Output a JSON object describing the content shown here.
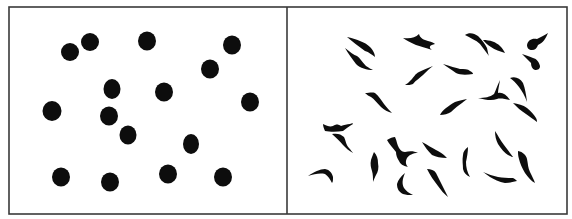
{
  "figure": {
    "width": 572,
    "height": 219,
    "frame": {
      "x": 9,
      "y": 7,
      "w": 558,
      "h": 207,
      "divider_x": 287,
      "color": "#3a3a3a"
    },
    "ink_color": "#0d0d0d",
    "background": "#ffffff"
  },
  "panels": [
    {
      "name": "left-panel-round-dots",
      "description": "round dots",
      "count": 16,
      "dots": [
        {
          "cx": 70,
          "cy": 52,
          "rx": 9,
          "ry": 9
        },
        {
          "cx": 90,
          "cy": 42,
          "rx": 9,
          "ry": 9
        },
        {
          "cx": 147,
          "cy": 41,
          "rx": 9,
          "ry": 9.5
        },
        {
          "cx": 232,
          "cy": 45,
          "rx": 9,
          "ry": 9.5
        },
        {
          "cx": 210,
          "cy": 69,
          "rx": 9,
          "ry": 9.5
        },
        {
          "cx": 112,
          "cy": 89,
          "rx": 8.5,
          "ry": 10
        },
        {
          "cx": 164,
          "cy": 92,
          "rx": 9,
          "ry": 9.5
        },
        {
          "cx": 52,
          "cy": 111,
          "rx": 9.5,
          "ry": 10
        },
        {
          "cx": 250,
          "cy": 102,
          "rx": 9,
          "ry": 9.5
        },
        {
          "cx": 109,
          "cy": 116,
          "rx": 9,
          "ry": 9.5
        },
        {
          "cx": 128,
          "cy": 135,
          "rx": 8.5,
          "ry": 9.5
        },
        {
          "cx": 191,
          "cy": 144,
          "rx": 8,
          "ry": 10
        },
        {
          "cx": 61,
          "cy": 177,
          "rx": 9,
          "ry": 9.5
        },
        {
          "cx": 110,
          "cy": 182,
          "rx": 9,
          "ry": 9.5
        },
        {
          "cx": 168,
          "cy": 174,
          "rx": 9,
          "ry": 9.5
        },
        {
          "cx": 223,
          "cy": 177,
          "rx": 9,
          "ry": 9.5
        }
      ]
    },
    {
      "name": "right-panel-irregular-spindle-shapes",
      "description": "elongated irregular spindle-shaped forms",
      "count": 25,
      "cells": [
        "M347,37 C356,39 365,42 370,47 C374,51 375,55 375,57 C372,55 369,52 365,51 C358,46 352,41 347,37 Z",
        "M345,48 C350,52 354,55 357,56 C360,58 362,62 366,66 C369,68 371,69 373,70 C367,70 360,68 356,64 C352,59 348,53 345,48 Z",
        "M403,38 C410,39 415,38 419,34 C420,38 424,40 428,41 C432,42 434,43 435,44 C430,45 428,47 432,50 C426,48 420,46 416,45 C411,43 406,40 403,38 Z",
        "M465,35 C469,32 474,33 478,36 C482,40 485,44 487,48 C488,52 488,54 489,56 C486,52 483,48 480,44 C476,40 470,38 465,35 Z M483,40 C490,40 496,42 500,46 C503,49 504,51 505,53 C500,51 495,50 491,47 C487,45 485,42 483,40 Z",
        "M527,45 C528,40 532,38 537,39 C541,37 545,35 548,33 C546,38 543,43 538,45 C537,48 535,50 532,50 C529,50 527,48 527,45 Z",
        "M522,54 C526,55 530,57 533,58 C537,59 539,62 540,66 C540,69 538,70 535,70 C532,69 531,66 531,63 C528,60 525,57 522,54 Z",
        "M433,66 C428,68 423,70 419,72 C415,74 414,77 411,80 C409,82 407,84 405,85 C408,85 411,85 413,84 C416,80 420,78 423,75 C427,71 430,68 433,66 Z",
        "M443,64 C450,66 456,68 460,69 C464,69 468,69 470,71 C472,72 473,73 473,74 C466,75 460,75 456,73 C452,70 447,67 443,64 Z",
        "M365,93 C369,93 372,92 375,93 C379,96 381,100 384,104 C387,108 390,111 392,113 C388,112 384,110 381,107 C377,103 374,99 371,97 C369,96 367,95 365,93 Z",
        "M467,99 C462,100 458,101 455,102 C451,104 449,106 446,108 C443,110 441,113 440,115 C444,115 448,114 451,112 C455,108 459,105 462,103 C464,101 466,100 467,99 Z",
        "M478,98 C485,98 490,97 494,94 C496,90 497,86 500,80 C499,86 498,90 498,93 C502,92 506,94 510,100 C505,99 500,98 497,99 C492,101 486,100 478,98 Z",
        "M510,78 C515,76 520,78 523,83 C525,88 526,94 527,102 C525,96 522,91 519,87 C516,83 513,80 510,78 Z",
        "M513,103 C518,104 523,105 527,108 C531,111 534,115 536,118 C537,120 537,121 537,122 C533,119 529,116 526,114 C521,111 517,107 513,103 Z",
        "M323,124 C327,126 330,127 333,126 C336,124 338,124 341,126 C344,125 347,124 350,124 C352,123 353,123 353,124 C349,126 346,129 343,131 C337,132 330,132 325,131 C324,129 323,126 323,124 Z",
        "M332,134 C337,133 341,134 344,137 C346,141 346,145 349,148 C351,150 352,152 353,153 C349,151 346,148 343,145 C340,141 336,138 332,134 Z",
        "M387,140 C390,138 393,137 395,137 C397,141 397,145 399,148 C401,151 403,152 405,152 C410,151 414,151 418,153 C413,153 409,155 407,158 C405,162 406,165 408,167 C403,166 400,164 399,161 C397,158 396,155 396,152 C393,148 389,144 387,140 Z",
        "M422,142 C428,145 432,148 436,150 C440,152 443,154 445,156 C446,157 447,158 447,158 C441,158 436,157 432,155 C428,151 425,147 422,142 Z",
        "M468,147 C465,149 463,152 463,155 C462,160 463,165 463,169 C464,173 466,175 470,177 C467,172 466,167 466,162 C467,157 468,152 468,147 Z",
        "M495,131 C495,136 496,140 498,144 C501,149 505,153 508,155 C510,156 512,157 513,157 C510,153 507,149 504,145 C500,140 498,135 495,131 Z",
        "M518,151 C523,152 526,155 527,159 C528,164 528,168 530,172 C532,176 534,180 535,183 C531,181 528,177 525,173 C522,168 520,163 519,159 C518,156 518,153 518,151 Z",
        "M374,152 C377,155 378,159 378,163 C379,168 378,172 376,175 C375,177 374,179 373,182 C373,178 373,174 372,171 C371,168 370,164 371,160 C372,157 373,154 374,152 Z",
        "M308,176 C314,172 320,169 325,169 C330,170 332,173 333,177 C333,180 333,182 332,183 C330,179 328,176 325,174 C320,173 314,174 308,176 Z",
        "M405,173 C401,176 398,180 397,184 C397,189 399,192 403,194 C406,195 409,195 413,195 C409,193 406,191 404,188 C402,184 402,180 405,173 Z",
        "M427,169 C431,169 434,170 436,173 C438,177 440,181 442,185 C444,189 446,193 448,197 C444,194 441,190 438,186 C434,181 430,175 427,169 Z",
        "M483,172 C488,174 493,176 498,177 C503,178 508,178 513,178 C515,179 516,180 517,181 C513,182 509,183 505,183 C499,182 494,179 490,177 C487,175 485,173 483,172 Z"
      ]
    }
  ]
}
